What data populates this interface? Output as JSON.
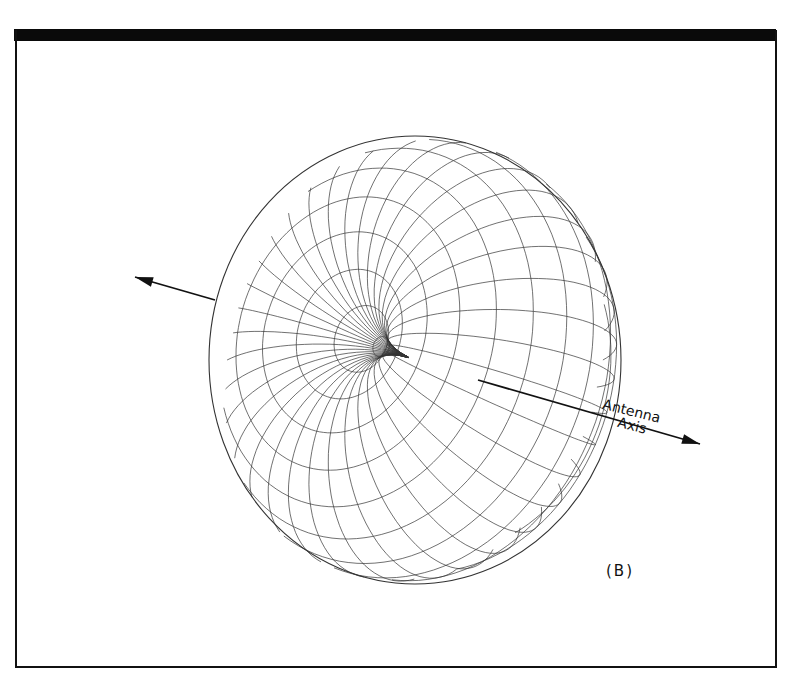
{
  "figure": {
    "panel_label": "(B)",
    "axis_label_line1": "Antenna",
    "axis_label_line2": "Axis"
  },
  "geometry": {
    "center": [
      415,
      360
    ],
    "radius_x": 206,
    "radius_y": 224,
    "dimple_center": [
      478,
      380
    ],
    "axis_arrow_left": {
      "from": [
        215,
        300
      ],
      "to": [
        135,
        277
      ]
    },
    "axis_arrow_right": {
      "from": [
        478,
        380
      ],
      "to": [
        700,
        444
      ]
    },
    "meridians": 36,
    "parallels": 18
  },
  "colors": {
    "line": "#333333",
    "frame": "#111111",
    "background": "#ffffff"
  }
}
